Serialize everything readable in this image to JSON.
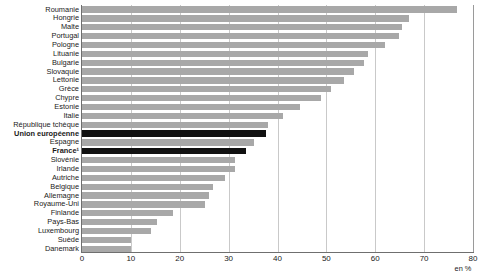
{
  "chart_data": {
    "type": "bar",
    "orientation": "horizontal",
    "title": "",
    "xlabel": "en %",
    "ylabel": "",
    "xlim": [
      0,
      80
    ],
    "xticks": [
      0,
      10,
      20,
      30,
      40,
      50,
      60,
      70,
      80
    ],
    "grid": true,
    "legend": null,
    "unit": "en %",
    "categories": [
      "Roumanie",
      "Hongrie",
      "Malte",
      "Portugal",
      "Pologne",
      "Lituanie",
      "Bulgarie",
      "Slovaquie",
      "Lettonie",
      "Grèce",
      "Chypre",
      "Estonie",
      "Italie",
      "République tchèque",
      "Union européenne",
      "Espagne",
      "France¹",
      "Slovénie",
      "Irlande",
      "Autriche",
      "Belgique",
      "Allemagne",
      "Royaume-Uni",
      "Finlande",
      "Pays-Bas",
      "Luxembourg",
      "Suède",
      "Danemark"
    ],
    "values": [
      76.7,
      67.0,
      65.4,
      64.8,
      62.0,
      58.6,
      57.6,
      55.6,
      53.6,
      51.0,
      48.8,
      44.6,
      41.2,
      38.0,
      37.6,
      35.1,
      33.5,
      31.3,
      31.3,
      29.2,
      26.8,
      26.0,
      25.1,
      18.6,
      15.3,
      14.1,
      10.0,
      10.0
    ],
    "highlighted": [
      "Union européenne",
      "France¹"
    ],
    "colors": {
      "bar": "#a8a8a8",
      "bar_highlight": "#111111",
      "grid": "#c9c9c9",
      "axis": "#6f6f6f",
      "text": "#1a1a1a"
    }
  }
}
